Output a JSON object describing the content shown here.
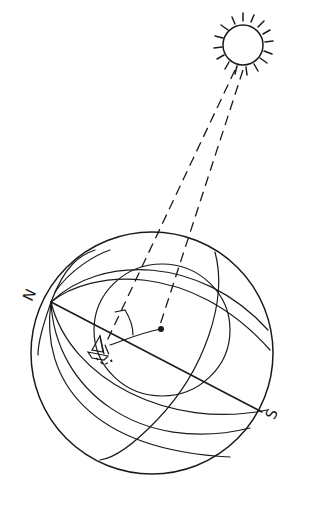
{
  "diagram": {
    "labels": {
      "north": "N",
      "south": "S"
    },
    "elements": {
      "sun": "sun-icon",
      "globe": "globe-with-meridians-and-parallels",
      "boat": "sailboat-icon",
      "sun_rays": "two parallel dashed rays from sun to globe",
      "subsolar_point": "dot on globe surface",
      "angle_marker": "arc between ray and zenith line at boat"
    },
    "colors": {
      "ink": "#1a1a1a",
      "background": "#ffffff"
    }
  }
}
